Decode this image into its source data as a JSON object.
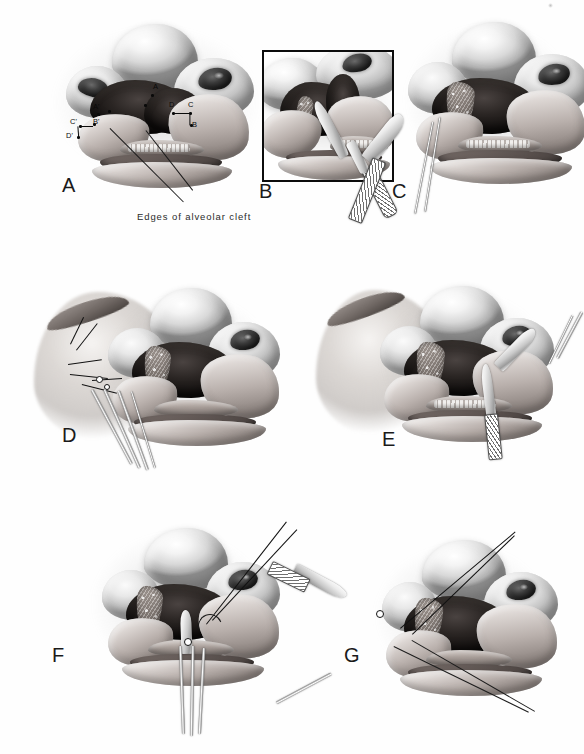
{
  "figure": {
    "kind": "surgical-illustration-plate",
    "panel_count": 7,
    "palette": {
      "ink": "#111111",
      "paper": "#ffffff",
      "wash": "#8e8e8e",
      "shadow": "#0d0d0d"
    },
    "caption": {
      "text": "Edges of alveolar cleft",
      "leader_count": 2
    },
    "panels": [
      {
        "id": "A",
        "letter": "A",
        "description": "Nose and cleft lip viewed from below showing planned incision landmarks on both sides of the alveolar cleft",
        "labels": [
          {
            "text": "A",
            "side": "right"
          },
          {
            "text": "B",
            "side": "right"
          },
          {
            "text": "C",
            "side": "right"
          },
          {
            "text": "D",
            "side": "right"
          },
          {
            "text": "A'",
            "side": "left"
          },
          {
            "text": "B'",
            "side": "left"
          },
          {
            "text": "C'",
            "side": "left"
          },
          {
            "text": "D'",
            "side": "left"
          }
        ]
      },
      {
        "id": "B",
        "letter": "B",
        "description": "Boxed close-up inset: scalpel incising the mucoperiosteum at the cleft margin",
        "boxed": true
      },
      {
        "id": "C",
        "letter": "C",
        "description": "Cleft exposed with cancellous bone graft bed; retractor engaged from the left"
      },
      {
        "id": "D",
        "letter": "D",
        "description": "Flap elevated with sutures placed on the lateral cheek; long forceps entering from below right"
      },
      {
        "id": "E",
        "letter": "E",
        "description": "Instruments approaching from the right; graft packed into the alveolar defect"
      },
      {
        "id": "F",
        "letter": "F",
        "description": "Needle holder passing a curved needle with long suture tails across the cleft"
      },
      {
        "id": "G",
        "letter": "G",
        "description": "Forceps from the left tying the suture; threads crossing the repaired cleft"
      }
    ]
  }
}
